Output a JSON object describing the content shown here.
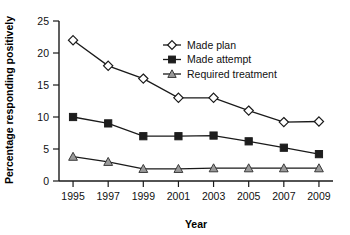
{
  "chart_data": {
    "type": "line",
    "title": "",
    "xlabel": "Year",
    "ylabel": "Percentage responding positively",
    "x": [
      1995,
      1997,
      1999,
      2001,
      2003,
      2005,
      2007,
      2009
    ],
    "categories": [
      "1995",
      "1997",
      "1999",
      "2001",
      "2003",
      "2005",
      "2007",
      "2009"
    ],
    "xtick_labels": [
      "1995",
      "1997",
      "1999",
      "2001",
      "2003",
      "2005",
      "2007",
      "2009"
    ],
    "ytick_labels": [
      "0",
      "5",
      "10",
      "15",
      "20",
      "25"
    ],
    "yticks": [
      0,
      5,
      10,
      15,
      20,
      25
    ],
    "ylim": [
      0,
      25
    ],
    "xlim": [
      1994.2,
      2009.8
    ],
    "grid": false,
    "legend_position": "upper-center-right",
    "series": [
      {
        "name": "Made plan",
        "marker": "open-diamond",
        "color": "#ffffff",
        "stroke": "#1a1a1a",
        "values": [
          22.0,
          18.0,
          16.0,
          13.0,
          13.0,
          11.0,
          9.2,
          9.3
        ]
      },
      {
        "name": "Made attempt",
        "marker": "filled-square",
        "color": "#1d1d1d",
        "stroke": "#1d1d1d",
        "values": [
          10.0,
          9.0,
          7.0,
          7.0,
          7.1,
          6.2,
          5.2,
          4.2
        ]
      },
      {
        "name": "Required treatment",
        "marker": "gray-triangle",
        "color": "#9a9a9a",
        "stroke": "#3a3a3a",
        "values": [
          3.8,
          3.0,
          1.9,
          1.9,
          2.0,
          2.0,
          2.0,
          2.0
        ]
      }
    ],
    "legend": [
      {
        "label": "Made plan",
        "marker": "open-diamond"
      },
      {
        "label": "Made attempt",
        "marker": "filled-square"
      },
      {
        "label": "Required treatment",
        "marker": "gray-triangle"
      }
    ]
  },
  "axis": {
    "y_title": "Percentage responding positively",
    "x_title": "Year"
  }
}
